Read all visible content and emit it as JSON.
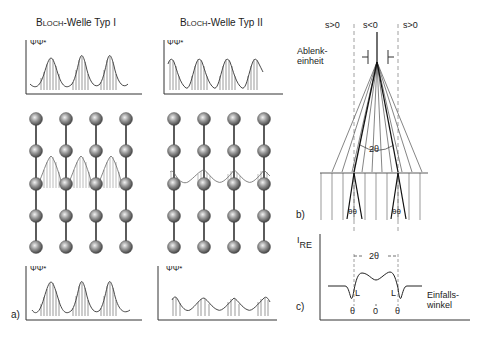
{
  "panel_a": {
    "label": "a)",
    "bloch_type_1": {
      "title_prefix_cap": "B",
      "title_prefix_small": "LOCH",
      "title_rest": "-Welle Typ I",
      "axis_label": "ΨΨ*"
    },
    "bloch_type_2": {
      "title_prefix_cap": "B",
      "title_prefix_small": "LOCH",
      "title_rest": "-Welle Typ II",
      "axis_label": "ΨΨ*"
    }
  },
  "panel_b": {
    "label": "b)",
    "s_left": "s>0",
    "s_center": "s<0",
    "s_right": "s>0",
    "deflector_line1": "Ablenk-",
    "deflector_line2": "einheit",
    "angle_2theta": "2θ",
    "angle_left": "θθ",
    "angle_right": "θθ"
  },
  "panel_c": {
    "label": "c)",
    "y_axis_main": "I",
    "y_axis_sub": "RE",
    "width_label": "2θ",
    "L_left": "L",
    "L_right": "L",
    "tick_left": "θ",
    "tick_center": "0",
    "tick_right": "θ",
    "x_axis_line1": "Einfalls-",
    "x_axis_line2": "winkel"
  },
  "colors": {
    "line": "#333333",
    "atom_dark": "#555555",
    "atom_light": "#e8e8e8",
    "dashed": "#888888"
  }
}
